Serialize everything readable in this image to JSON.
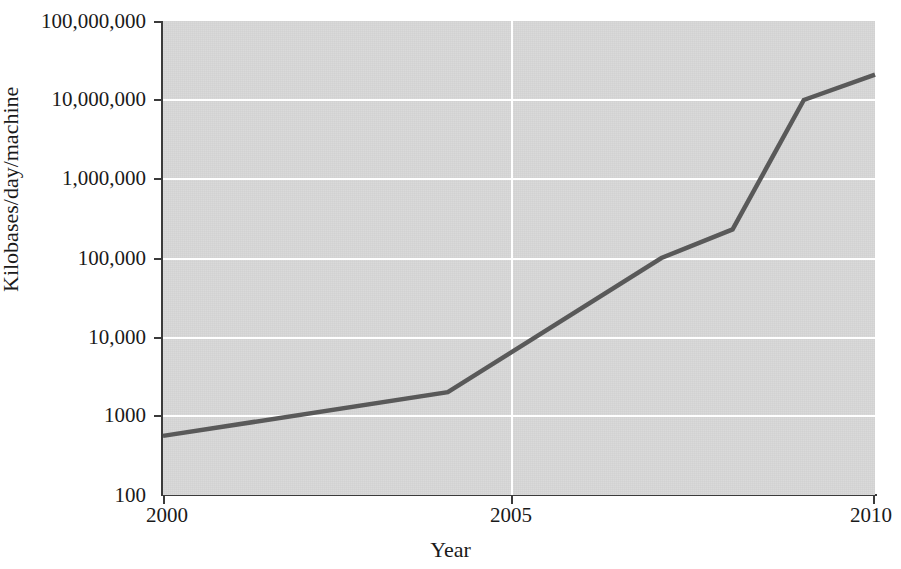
{
  "chart_data": {
    "type": "line",
    "title": "",
    "xlabel": "Year",
    "ylabel": "Kilobases/day/machine",
    "yscale": "log",
    "xlim": [
      2000,
      2010
    ],
    "ylim": [
      100,
      100000000
    ],
    "grid": true,
    "legend": "none",
    "x_ticks": [
      "2000",
      "2005",
      "2010"
    ],
    "x_tick_values": [
      2000,
      2005,
      2010
    ],
    "y_ticks": [
      "100",
      "1000",
      "10,000",
      "100,000",
      "1,000,000",
      "10,000,000",
      "100,000,000"
    ],
    "y_tick_values": [
      100,
      1000,
      10000,
      100000,
      1000000,
      10000000,
      100000000
    ],
    "series": [
      {
        "name": "Sequencing throughput",
        "x": [
          2000,
          2004,
          2007,
          2008,
          2009,
          2010
        ],
        "values": [
          560,
          2000,
          100000,
          230000,
          10000000,
          21000000
        ]
      }
    ],
    "colors": {
      "line": "#595959",
      "plot_background": "#d6d6d6",
      "gridline": "#ffffff",
      "axis": "#3b3b3b",
      "text": "#1a1a1a",
      "page_background": "#ffffff"
    }
  }
}
